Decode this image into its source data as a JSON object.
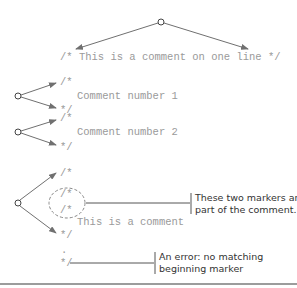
{
  "diagram": {
    "single_line_comment": "/* This is a comment on one line */",
    "group1": {
      "open": "/*",
      "body": "Comment number 1",
      "close": "*/"
    },
    "group2": {
      "open": "/*",
      "body": "Comment number 2",
      "close": "*/"
    },
    "group3": {
      "open": "/*",
      "inner_marker_1": "/*",
      "inner_marker_2": "/*",
      "body": "This is a comment",
      "close": "*/",
      "ellipsis_dot": ".",
      "stray_close": "*/"
    },
    "annotations": {
      "nested_markers": {
        "line1": "These two markers are",
        "line2": "part of the comment."
      },
      "error": {
        "line1": "An error: no matching",
        "line2": "beginning marker"
      }
    },
    "colors": {
      "code_text": "#9a9a9a",
      "arrow": "#707070",
      "annotation_text": "#333333",
      "divider": "#9c9c9c"
    }
  }
}
